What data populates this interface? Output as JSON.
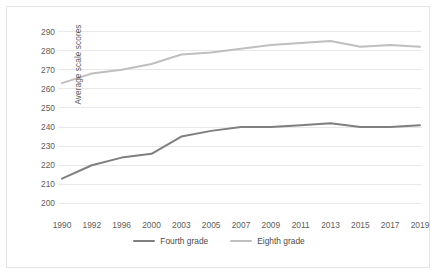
{
  "chart_data": {
    "type": "line",
    "title": "",
    "xlabel": "",
    "ylabel": "Average scale scores",
    "categories": [
      "1990",
      "1992",
      "1996",
      "2000",
      "2003",
      "2005",
      "2007",
      "2009",
      "2011",
      "2013",
      "2015",
      "2017",
      "2019"
    ],
    "ylim": [
      195,
      295
    ],
    "yticks": [
      200,
      210,
      220,
      230,
      240,
      250,
      260,
      270,
      280,
      290
    ],
    "grid": true,
    "legend_position": "bottom",
    "series": [
      {
        "name": "Fourth grade",
        "color": "#7f7f7f",
        "values": [
          213,
          220,
          224,
          226,
          235,
          238,
          240,
          240,
          241,
          242,
          240,
          240,
          241
        ]
      },
      {
        "name": "Eighth grade",
        "color": "#bfbfbf",
        "values": [
          263,
          268,
          270,
          273,
          278,
          279,
          281,
          283,
          284,
          285,
          282,
          283,
          282
        ]
      }
    ]
  },
  "axes": {
    "y_title": "Average scale scores"
  },
  "colors": {
    "fourth_grade": "#7f7f7f",
    "eighth_grade": "#bfbfbf",
    "gridline": "#e8e8e8",
    "text": "#5d5d5d",
    "frame": "#e4e4e4"
  }
}
